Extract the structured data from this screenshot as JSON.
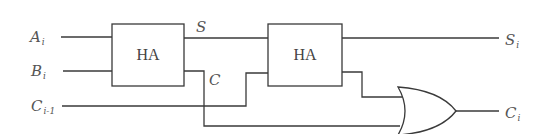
{
  "diagram": {
    "inputs": [
      {
        "id": "A",
        "main": "A",
        "sub": "i"
      },
      {
        "id": "B",
        "main": "B",
        "sub": "i"
      },
      {
        "id": "Cin",
        "main": "C",
        "sub": "i-1"
      }
    ],
    "outputs": [
      {
        "id": "S",
        "main": "S",
        "sub": "i"
      },
      {
        "id": "Cout",
        "main": "C",
        "sub": "i"
      }
    ],
    "blocks": [
      {
        "id": "HA1",
        "label": "HA"
      },
      {
        "id": "HA2",
        "label": "HA"
      }
    ],
    "intermediate_labels": {
      "sum": "S",
      "carry": "C"
    },
    "gates": [
      {
        "id": "OR1",
        "type": "OR"
      }
    ],
    "colors": {
      "stroke": "#3a3a3a",
      "text": "#555555",
      "background": "#ffffff"
    }
  }
}
